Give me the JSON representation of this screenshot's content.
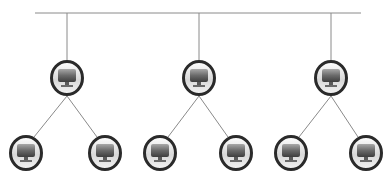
{
  "diagram": {
    "type": "tree-network-topology",
    "colors": {
      "line": "#8a8a8a",
      "ring": "#2a2a2a",
      "screen_top": "#9a9a9a",
      "screen_bottom": "#4a4a4a",
      "base": "#e6e6e6"
    },
    "bus": {
      "x1": 35,
      "x2": 361,
      "y": 13
    },
    "nodes": [
      {
        "id": "hub-1",
        "icon": "computer-icon",
        "x": 67,
        "y": 78,
        "level": 1
      },
      {
        "id": "hub-2",
        "icon": "computer-icon",
        "x": 199,
        "y": 78,
        "level": 1
      },
      {
        "id": "hub-3",
        "icon": "computer-icon",
        "x": 331,
        "y": 78,
        "level": 1
      },
      {
        "id": "leaf-1",
        "icon": "computer-icon",
        "x": 26,
        "y": 153,
        "level": 2,
        "parent": "hub-1"
      },
      {
        "id": "leaf-2",
        "icon": "computer-icon",
        "x": 105,
        "y": 153,
        "level": 2,
        "parent": "hub-1"
      },
      {
        "id": "leaf-3",
        "icon": "computer-icon",
        "x": 160,
        "y": 153,
        "level": 2,
        "parent": "hub-2"
      },
      {
        "id": "leaf-4",
        "icon": "computer-icon",
        "x": 236,
        "y": 153,
        "level": 2,
        "parent": "hub-2"
      },
      {
        "id": "leaf-5",
        "icon": "computer-icon",
        "x": 291,
        "y": 153,
        "level": 2,
        "parent": "hub-3"
      },
      {
        "id": "leaf-6",
        "icon": "computer-icon",
        "x": 366,
        "y": 153,
        "level": 2,
        "parent": "hub-3"
      }
    ]
  }
}
